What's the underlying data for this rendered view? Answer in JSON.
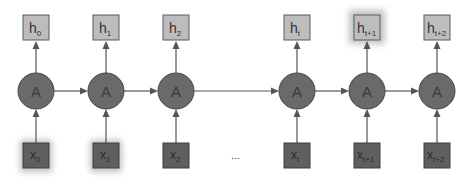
{
  "diagram": {
    "type": "unrolled-rnn",
    "cell_label": "A",
    "ellipsis": "...",
    "columns": [
      {
        "h_base": "h",
        "h_sub": "0",
        "x_base": "x",
        "x_sub": "0",
        "cx": 36
      },
      {
        "h_base": "h",
        "h_sub": "1",
        "x_base": "x",
        "x_sub": "1",
        "cx": 106
      },
      {
        "h_base": "h",
        "h_sub": "2",
        "x_base": "x",
        "x_sub": "2",
        "cx": 176
      },
      {
        "h_base": "h",
        "h_sub": "t",
        "x_base": "x",
        "x_sub": "t",
        "cx": 297
      },
      {
        "h_base": "h",
        "h_sub": "t+1",
        "x_base": "x",
        "x_sub": "t+1",
        "cx": 367
      },
      {
        "h_base": "h",
        "h_sub": "t+2",
        "x_base": "x",
        "x_sub": "t+2",
        "cx": 437
      }
    ],
    "colors": {
      "output_box": "#bdbdbd",
      "input_box": "#5f5f5f",
      "cell": "#6a6a6a",
      "edge": "#555555"
    }
  }
}
